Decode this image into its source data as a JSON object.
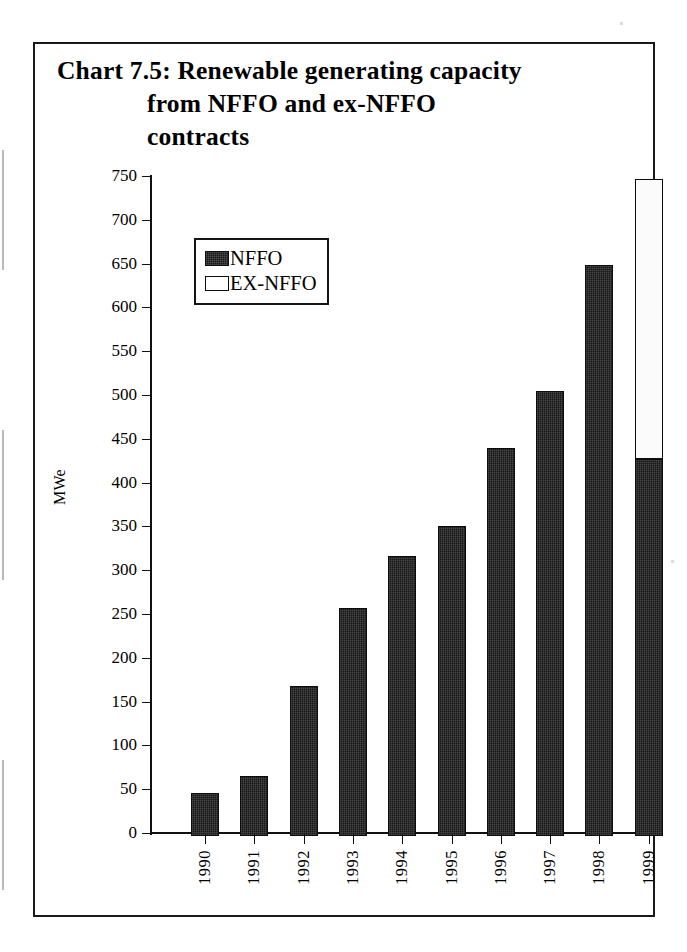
{
  "chart_data": {
    "type": "bar",
    "title": "Chart 7.5:  Renewable generating capacity from NFFO and ex-NFFO contracts",
    "title_lines": [
      "Chart 7.5:  Renewable generating capacity",
      "from NFFO and ex-NFFO",
      "contracts"
    ],
    "stacked": true,
    "xlabel": "",
    "ylabel": "MWe",
    "ylim": [
      0,
      750
    ],
    "ytick_step": 50,
    "grid": false,
    "legend_position": "upper-left-inside",
    "categories": [
      "1990",
      "1991",
      "1992",
      "1993",
      "1994",
      "1995",
      "1996",
      "1997",
      "1998",
      "1999"
    ],
    "ytick_labels": [
      "750",
      "700",
      "650",
      "600",
      "550",
      "500",
      "450",
      "400",
      "350",
      "300",
      "250",
      "200",
      "150",
      "100",
      "50",
      "0"
    ],
    "series": [
      {
        "name": "NFFO",
        "color": "#171717",
        "values": [
          49,
          68,
          171,
          260,
          320,
          354,
          443,
          508,
          652,
          430
        ]
      },
      {
        "name": "EX-NFFO",
        "color": "#ffffff",
        "values": [
          0,
          0,
          0,
          0,
          0,
          0,
          0,
          0,
          0,
          320
        ]
      }
    ],
    "totals": [
      49,
      68,
      171,
      260,
      320,
      354,
      443,
      508,
      652,
      750
    ]
  },
  "legend": {
    "items": [
      {
        "label": "NFFO",
        "swatch": "black"
      },
      {
        "label": "EX-NFFO",
        "swatch": "white"
      }
    ]
  },
  "axis": {
    "y_title": "MWe"
  }
}
